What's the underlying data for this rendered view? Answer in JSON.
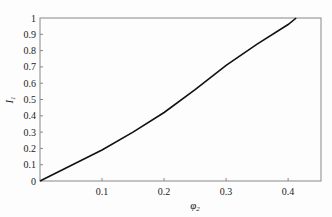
{
  "chart_data": {
    "type": "line",
    "title": "",
    "xlabel": "φ2",
    "ylabel": "I1",
    "xlim": [
      0,
      0.453
    ],
    "ylim": [
      0,
      1
    ],
    "xticks": [
      "0.1",
      "0.2",
      "0.3",
      "0.4"
    ],
    "yticks": [
      "0",
      "0.1",
      "0.2",
      "0.3",
      "0.4",
      "0.5",
      "0.6",
      "0.7",
      "0.8",
      "0.9",
      "1"
    ],
    "grid": false,
    "series": [
      {
        "name": "I1",
        "color": "#111111",
        "x": [
          0,
          0.05,
          0.1,
          0.15,
          0.2,
          0.25,
          0.3,
          0.35,
          0.4,
          0.413
        ],
        "values": [
          0,
          0.095,
          0.19,
          0.3,
          0.42,
          0.56,
          0.71,
          0.84,
          0.96,
          1.0
        ]
      }
    ]
  }
}
